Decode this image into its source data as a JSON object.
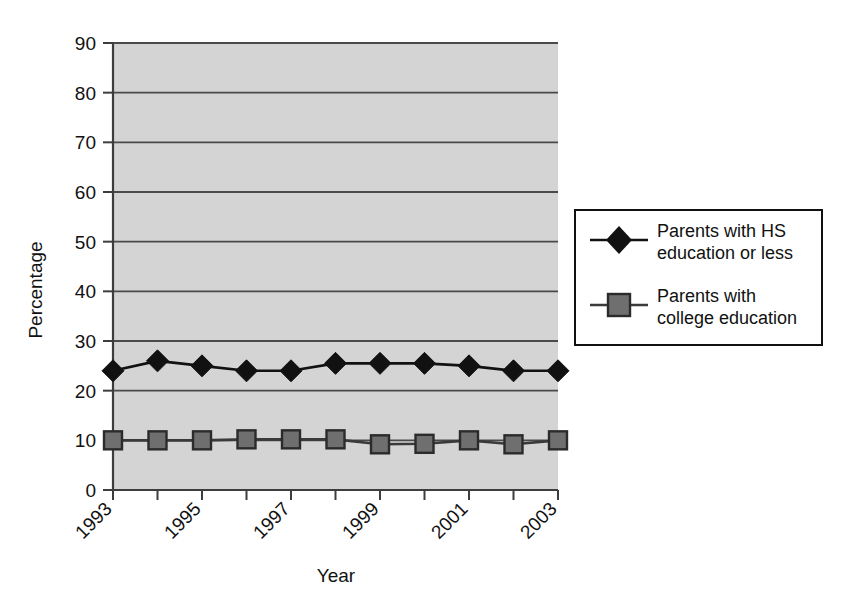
{
  "chart_data": {
    "type": "line",
    "title": "",
    "xlabel": "Year",
    "ylabel": "Percentage",
    "ylim": [
      0,
      90
    ],
    "ytick_step": 10,
    "yticks": [
      "0",
      "10",
      "20",
      "30",
      "40",
      "50",
      "60",
      "70",
      "80",
      "90"
    ],
    "categories": [
      1993,
      1994,
      1995,
      1996,
      1997,
      1998,
      1999,
      2000,
      2001,
      2002,
      2003
    ],
    "xtick_labels": [
      "1993",
      "",
      "1995",
      "",
      "1997",
      "",
      "1999",
      "",
      "2001",
      "",
      "2003"
    ],
    "xtick_labels_visible": [
      "1993",
      "1995",
      "1997",
      "1999",
      "2001",
      "2003"
    ],
    "grid": "horizontal",
    "legend_position": "right",
    "plot_background": "#d4d4d4",
    "series": [
      {
        "name": "Parents with HS education or less",
        "marker": "diamond",
        "color": "#111111",
        "marker_fill": "#111111",
        "values": [
          24,
          26,
          25,
          24,
          24,
          25.5,
          25.5,
          25.5,
          25,
          24,
          24
        ]
      },
      {
        "name": "Parents with college education",
        "marker": "square",
        "color": "#3a3a3a",
        "marker_fill": "#6f6f6f",
        "values": [
          10,
          10,
          10,
          10.2,
          10.2,
          10.2,
          9.2,
          9.3,
          10,
          9.2,
          10
        ]
      }
    ]
  },
  "legend": {
    "entries": [
      {
        "label_line1": "Parents with HS",
        "label_line2": "education or less",
        "marker": "diamond-marker"
      },
      {
        "label_line1": "Parents with",
        "label_line2": "college education",
        "marker": "square-marker"
      }
    ]
  },
  "axes": {
    "y_title": "Percentage",
    "x_title": "Year"
  }
}
